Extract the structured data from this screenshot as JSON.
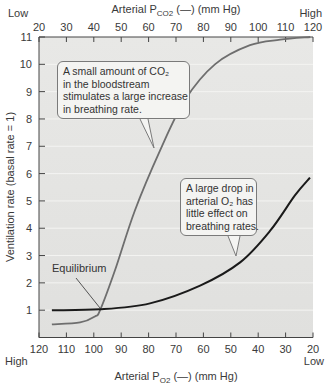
{
  "chart_data": {
    "type": "line",
    "title": "",
    "top_axis": {
      "label": "Arterial P_CO2 (—) (mm Hg)",
      "label_main": "Arterial P",
      "label_sub": "CO",
      "label_sub2": "2",
      "label_tail": " (—) (mm Hg)",
      "ticks": [
        20,
        30,
        40,
        50,
        60,
        70,
        80,
        90,
        100,
        110,
        120
      ],
      "low_label": "Low",
      "high_label": "High",
      "range": [
        20,
        120
      ]
    },
    "bottom_axis": {
      "label": "Arterial P_O2 (—) (mm Hg)",
      "label_main": "Arterial P",
      "label_sub": "O",
      "label_sub2": "2",
      "label_tail": " (—) (mm Hg)",
      "ticks": [
        120,
        110,
        100,
        90,
        80,
        70,
        60,
        50,
        40,
        30,
        20
      ],
      "high_label": "High",
      "low_label": "Low",
      "range": [
        120,
        20
      ]
    },
    "ylabel": "Ventilation rate (basal rate = 1)",
    "yticks": [
      1,
      2,
      3,
      4,
      5,
      6,
      7,
      8,
      9,
      10,
      11
    ],
    "ylim": [
      0,
      11
    ],
    "grid": true,
    "series": [
      {
        "name": "Arterial PCO2",
        "axis": "top",
        "color": "#6e6e6e",
        "x": [
          24.7,
          35,
          40.4,
          42.3,
          47.7,
          55,
          64.2,
          73.3,
          84.2,
          97,
          108,
          119
        ],
        "values": [
          0.48,
          0.55,
          0.77,
          1.0,
          2.45,
          4.65,
          6.85,
          8.7,
          10.0,
          10.7,
          10.9,
          11.0
        ]
      },
      {
        "name": "Arterial PO2",
        "axis": "bottom",
        "color": "#1a1a1a",
        "x": [
          115.3,
          97.7,
          79.5,
          61.2,
          46.6,
          35.7,
          26.6,
          21.1
        ],
        "values": [
          1.0,
          1.03,
          1.25,
          1.9,
          2.75,
          3.9,
          5.2,
          5.85
        ]
      }
    ],
    "annotations": [
      {
        "text": "Equilibrium",
        "point": [
          100,
          1.0
        ]
      },
      {
        "text_lines": [
          "A small amount of CO₂",
          "in the bloodstream",
          "stimulates a large increase",
          "in breathing rate."
        ]
      },
      {
        "text_lines": [
          "A large drop in",
          "arterial O₂ has",
          "little effect on",
          "breathing rates."
        ]
      }
    ]
  },
  "callouts": {
    "co2": [
      "A small amount of CO₂",
      "in the bloodstream",
      "stimulates a large increase",
      "in breathing rate."
    ],
    "o2": [
      "A large drop in",
      "arterial O₂ has",
      "little effect on",
      "breathing rates."
    ],
    "equilibrium": "Equilibrium"
  },
  "colors": {
    "plot_bg": "#e4e4e2",
    "grid": "#f4f4f2",
    "co2_curve": "#6e6e6e",
    "o2_curve": "#1a1a1a",
    "axis": "#444444"
  }
}
